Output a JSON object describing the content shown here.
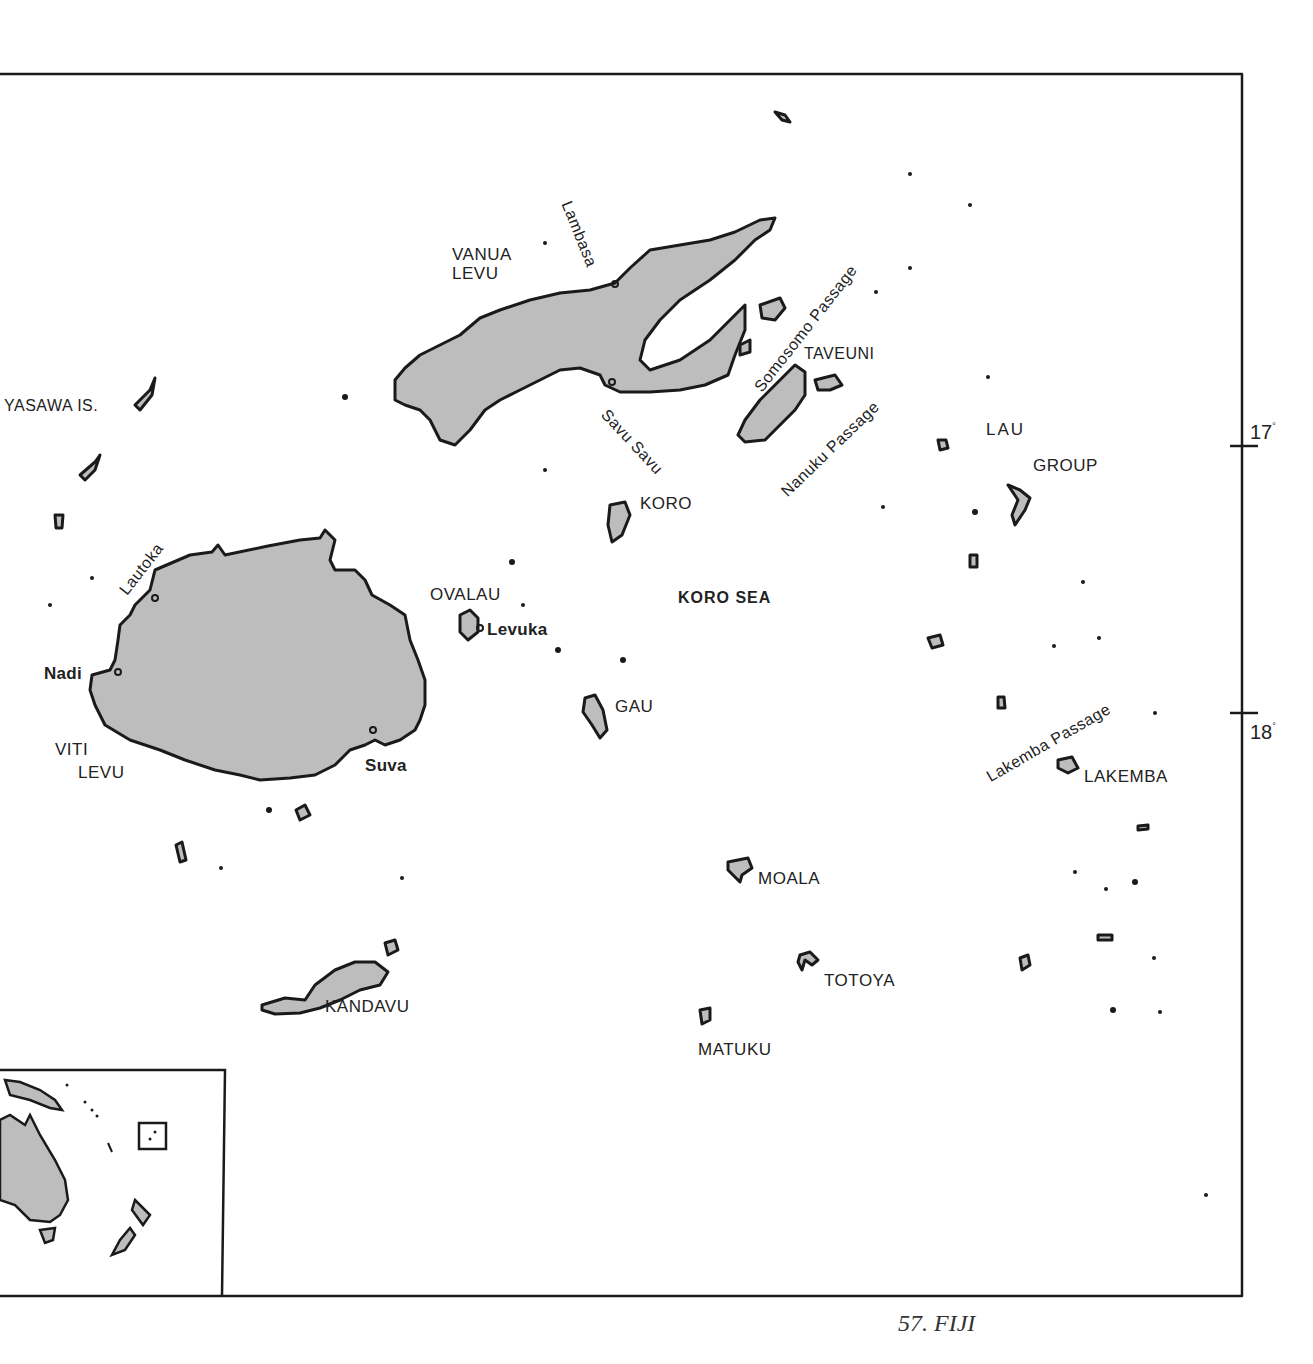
{
  "map": {
    "title": "FIJI",
    "caption": "57.  FIJI",
    "land_fill": "#bdbdbd",
    "outline_color": "#1a1a1a",
    "latitude_ticks": [
      {
        "label": "17",
        "unit": "°"
      },
      {
        "label": "18",
        "unit": "°"
      }
    ],
    "islands": {
      "vanua_levu": "VANUA\nLEVU",
      "vanua_levu_l1": "VANUA",
      "vanua_levu_l2": "LEVU",
      "viti_levu_l1": "VITI",
      "viti_levu_l2": "LEVU",
      "yasawa": "YASAWA IS.",
      "taveuni": "TAVEUNI",
      "koro": "KORO",
      "ovalau": "OVALAU",
      "gau": "GAU",
      "lau_l1": "LAU",
      "lau_l2": "GROUP",
      "lakemba": "LAKEMBA",
      "moala": "MOALA",
      "totoya": "TOTOYA",
      "matuku": "MATUKU",
      "kandavu": "KANDAVU"
    },
    "towns": {
      "lambasa": "Lambasa",
      "savu_savu": "Savu Savu",
      "lautoka": "Lautoka",
      "nadi": "Nadi",
      "suva": "Suva",
      "levuka": "Levuka"
    },
    "seas": {
      "koro_sea": "KORO SEA",
      "somosomo": "Somosomo Passage",
      "nanuku": "Nanuku Passage",
      "lakemba_passage": "Lakemba Passage"
    },
    "inset": {
      "description": "Locator inset: Australia, New Zealand, Fiji box"
    }
  }
}
